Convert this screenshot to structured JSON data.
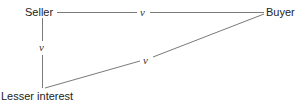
{
  "diagram": {
    "nodes": [
      {
        "id": "seller",
        "label": "Seller"
      },
      {
        "id": "buyer",
        "label": "Buyer"
      },
      {
        "id": "lesser",
        "label": "Lesser interest"
      }
    ],
    "edges": [
      {
        "from": "seller",
        "to": "buyer",
        "label": "v"
      },
      {
        "from": "seller",
        "to": "lesser",
        "label": "v"
      },
      {
        "from": "lesser",
        "to": "buyer",
        "label": "v"
      }
    ]
  }
}
